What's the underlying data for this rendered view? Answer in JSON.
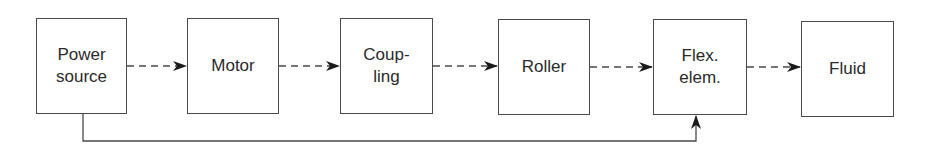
{
  "diagram": {
    "type": "block-flow",
    "blocks": [
      {
        "id": "power",
        "label": "Power\nsource",
        "x": 36,
        "y": 18,
        "w": 91,
        "h": 96
      },
      {
        "id": "motor",
        "label": "Motor",
        "x": 187,
        "y": 18,
        "w": 92,
        "h": 96
      },
      {
        "id": "coupling",
        "label": "Coup-\nling",
        "x": 340,
        "y": 18,
        "w": 93,
        "h": 96
      },
      {
        "id": "roller",
        "label": "Roller",
        "x": 498,
        "y": 19,
        "w": 92,
        "h": 96
      },
      {
        "id": "flex",
        "label": "Flex.\nelem.",
        "x": 653,
        "y": 19,
        "w": 94,
        "h": 96
      },
      {
        "id": "fluid",
        "label": "Fluid",
        "x": 801,
        "y": 21,
        "w": 93,
        "h": 96
      }
    ],
    "connections": [
      {
        "from": "power",
        "to": "motor",
        "style": "dashed"
      },
      {
        "from": "motor",
        "to": "coupling",
        "style": "dashed"
      },
      {
        "from": "coupling",
        "to": "roller",
        "style": "dashed"
      },
      {
        "from": "roller",
        "to": "flex",
        "style": "dashed"
      },
      {
        "from": "flex",
        "to": "fluid",
        "style": "dashed"
      },
      {
        "from": "power",
        "to": "flex",
        "style": "solid",
        "route": "feedback-below"
      }
    ],
    "colors": {
      "stroke": "#4a4a4a",
      "arrow": "#1a1a1a",
      "background": "#ffffff"
    }
  }
}
